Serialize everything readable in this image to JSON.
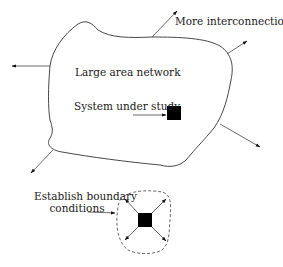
{
  "diagram": {
    "labels": {
      "more_interconnections": "More interconnections",
      "large_area_network": "Large area network",
      "system_under_study": "System under study",
      "establish_boundary_line1": "Establish boundary",
      "establish_boundary_line2": "conditions"
    },
    "colors": {
      "line": "#333333",
      "fill_box": "#000000",
      "background": "#ffffff"
    },
    "nodes": [
      {
        "id": "network-region",
        "shape": "irregular-closed-curve",
        "label": "Large area network"
      },
      {
        "id": "system-box",
        "shape": "filled-square",
        "label": "System under study"
      },
      {
        "id": "boundary-region",
        "shape": "dashed-closed-curve",
        "label": "Establish boundary conditions"
      },
      {
        "id": "boundary-box",
        "shape": "filled-square"
      }
    ],
    "edges": [
      {
        "from": "network-region",
        "direction": "up-right",
        "label": "More interconnections"
      },
      {
        "from": "network-region",
        "direction": "right"
      },
      {
        "from": "network-region",
        "direction": "left"
      },
      {
        "from": "network-region",
        "direction": "down-right"
      },
      {
        "from": "network-region",
        "direction": "down-left"
      },
      {
        "from": "system-under-study-label",
        "to": "system-box"
      },
      {
        "from": "establish-boundary-label",
        "to": "boundary-region"
      },
      {
        "from": "boundary-box",
        "direction": "up-left"
      },
      {
        "from": "boundary-box",
        "direction": "up-right"
      },
      {
        "from": "boundary-box",
        "direction": "down-left"
      },
      {
        "from": "boundary-box",
        "direction": "down-right"
      }
    ]
  }
}
